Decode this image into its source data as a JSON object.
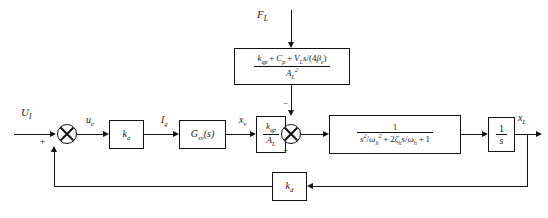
{
  "diagram": {
    "signals": {
      "input": "U",
      "input_sub": "I",
      "error": "u",
      "error_sub": "e",
      "current": "I",
      "current_sub": "g",
      "valve": "x",
      "valve_sub": "v",
      "disturbance": "F",
      "disturbance_sub": "L",
      "output": "x",
      "output_sub": "L"
    },
    "signs": {
      "sum1_plus": "+",
      "sum1_minus": "−",
      "sum2_plus": "+",
      "sum2_minus": "−"
    },
    "blocks": {
      "amplifier": {
        "name": "k",
        "sub": "a"
      },
      "servo_valve": {
        "name": "G",
        "sub": "sv",
        "arg": "(s)"
      },
      "flow_gain": {
        "num_k": "k",
        "num_sub": "qp",
        "den_a": "A",
        "den_sub": "L"
      },
      "disturbance_tf": {
        "num_k": "k",
        "num_k_sub": "qp",
        "num_c": "C",
        "num_c_sub": "p",
        "num_v": "V",
        "num_v_sub": "L",
        "num_s": "s",
        "num_den_4": "4",
        "num_beta": "β",
        "num_beta_sub": "e",
        "den_a": "A",
        "den_a_sub": "L",
        "den_a_pow": "2"
      },
      "plant": {
        "numerator": "1",
        "den_s": "s",
        "den_s_pow": "2",
        "den_w": "ω",
        "den_w_sub": "h",
        "den_w_pow": "2",
        "den_two": "2",
        "den_zeta": "ζ",
        "den_zeta_sub": "h",
        "den_s2": "s",
        "den_w2": "ω",
        "den_w2_sub": "h",
        "den_one": "1"
      },
      "integrator": {
        "num": "1",
        "den": "s"
      },
      "feedback": {
        "name": "k",
        "sub": "d"
      }
    }
  }
}
